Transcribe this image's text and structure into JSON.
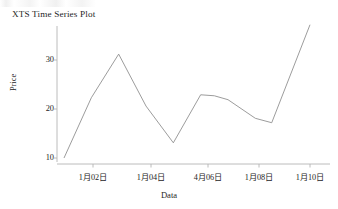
{
  "chart_data": {
    "type": "line",
    "title": "XTS Time Series Plot",
    "xlabel": "Data",
    "ylabel": "Price",
    "grid": false,
    "legend": null,
    "xlim": [
      1,
      10
    ],
    "ylim": [
      9.0,
      38.5
    ],
    "ytick_values": [
      10,
      20,
      30
    ],
    "ytick_labels": [
      "10",
      "20",
      "30"
    ],
    "xtick_positions": [
      2,
      4,
      6,
      8,
      10
    ],
    "xtick_labels": [
      "1月02日",
      "1月04日",
      "4月06日",
      "1月08日",
      "1月10日"
    ],
    "x": [
      1,
      2,
      3,
      4,
      5,
      6,
      6.5,
      7,
      8,
      8.6,
      10
    ],
    "values": [
      10.0,
      22.3,
      31.2,
      20.6,
      13.1,
      22.9,
      22.7,
      21.9,
      18.1,
      17.2,
      37.2
    ],
    "line_color": "#8a8a8a",
    "axis_color": "#b4b4b4",
    "background_color": "#ffffff"
  },
  "axes": {
    "y_title": "Price",
    "x_title": "Data",
    "y_labels": [
      "30",
      "20",
      "10"
    ],
    "x_labels": [
      "1月02日",
      "1月04日",
      "4月06日",
      "1月08日",
      "1月10日"
    ]
  },
  "header": {
    "title": "XTS Time Series Plot"
  }
}
